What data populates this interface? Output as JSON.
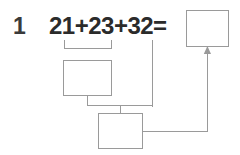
{
  "problem": {
    "number": "1",
    "equation": "21+23+32=",
    "operands": [
      21,
      23,
      32
    ],
    "operator": "+",
    "equals_sign": "=",
    "total": 76
  },
  "boxes": [
    {
      "name": "sum-box",
      "value": "",
      "placeholder": ""
    },
    {
      "name": "partial-sum-box-1",
      "value": "",
      "placeholder": ""
    },
    {
      "name": "partial-sum-box-2",
      "value": "",
      "placeholder": ""
    }
  ],
  "connectors": {
    "bracket_label": "groups 21 and 23",
    "arrow_label": "result flows to sum box"
  },
  "colors": {
    "text": "#2b2b2b",
    "number_label": "#3a3a3a",
    "line": "#9a9a9a",
    "background": "#ffffff"
  }
}
